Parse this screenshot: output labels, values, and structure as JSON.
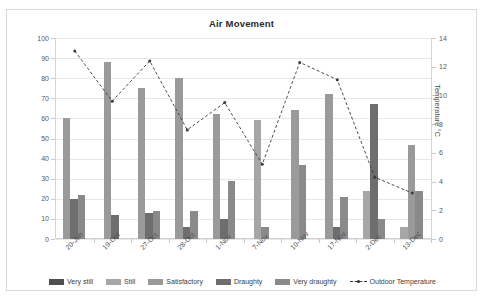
{
  "chart_data": {
    "type": "bar",
    "title": "Air Movement",
    "xlabel": "",
    "ylabel": "Satisfaction %",
    "y2label": "Temperature °C",
    "ylim": [
      0,
      100
    ],
    "y2lim": [
      0,
      14
    ],
    "ytick_step": 10,
    "y2tick_step": 2,
    "grid": true,
    "legend_position": "bottom",
    "categories": [
      "20-Jun",
      "19-Oct",
      "27-Oct",
      "28-Oct",
      "1-Nov",
      "7-Nov",
      "10-Nov",
      "17-Nov",
      "2-Dec",
      "13-Dec"
    ],
    "yticks": [
      0,
      10,
      20,
      30,
      40,
      50,
      60,
      70,
      80,
      90,
      100
    ],
    "y2ticks": [
      0,
      2,
      4,
      6,
      8,
      10,
      12,
      14
    ],
    "series": [
      {
        "name": "Very still",
        "color": "#4f4f4f",
        "axis": "left",
        "values": [
          0,
          0,
          0,
          0,
          0,
          0,
          0,
          0,
          0,
          0
        ]
      },
      {
        "name": "Still",
        "color": "#a6a6a6",
        "axis": "left",
        "values": [
          0,
          0,
          0,
          0,
          0,
          59,
          0,
          0,
          24,
          6
        ]
      },
      {
        "name": "Satisfactory",
        "color": "#9a9a9a",
        "axis": "left",
        "values": [
          60,
          88,
          75,
          80,
          62,
          0,
          64,
          72,
          0,
          47
        ]
      },
      {
        "name": "Draughty",
        "color": "#6e6e6e",
        "axis": "left",
        "values": [
          20,
          12,
          13,
          6,
          10,
          0,
          0,
          6,
          67,
          0
        ]
      },
      {
        "name": "Very draughty",
        "color": "#8a8a8a",
        "axis": "left",
        "values": [
          22,
          0,
          14,
          14,
          29,
          6,
          37,
          21,
          10,
          24
        ]
      },
      {
        "name": "Outdoor Temperature",
        "color": "#3b3b3b",
        "axis": "right",
        "type": "line",
        "style": "dashed",
        "values": [
          13.1,
          9.6,
          12.4,
          7.6,
          9.5,
          5.2,
          12.3,
          11.1,
          4.3,
          3.2
        ]
      }
    ]
  },
  "legend": {
    "items": [
      {
        "label": "Very still",
        "color": "#4f4f4f",
        "kind": "swatch"
      },
      {
        "label": "Still",
        "color": "#a6a6a6",
        "kind": "swatch"
      },
      {
        "label": "Satisfactory",
        "color": "#9a9a9a",
        "kind": "swatch"
      },
      {
        "label": "Draughty",
        "color": "#6e6e6e",
        "kind": "swatch"
      },
      {
        "label": "Very draughty",
        "color": "#8a8a8a",
        "kind": "swatch"
      },
      {
        "label": "Outdoor Temperature",
        "color": "#3b3b3b",
        "kind": "line"
      }
    ]
  }
}
